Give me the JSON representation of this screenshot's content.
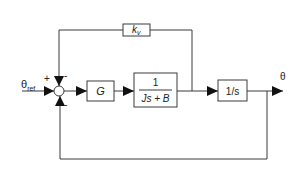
{
  "diagram": {
    "type": "control-block-diagram",
    "input_label": "θ",
    "input_subscript": "ref",
    "output_label": "θ",
    "summing_junction": {
      "signs": {
        "left": "+",
        "top": "-",
        "bottom": "-"
      }
    },
    "blocks": {
      "controller": "G",
      "plant_numerator": "1",
      "plant_denominator": "Js + B",
      "integrator": "1/s",
      "velocity_feedback": "k",
      "velocity_feedback_subscript": "v"
    },
    "colors": {
      "line": "#3a3a3a",
      "arrow": "#111111",
      "background": "#ffffff"
    }
  }
}
